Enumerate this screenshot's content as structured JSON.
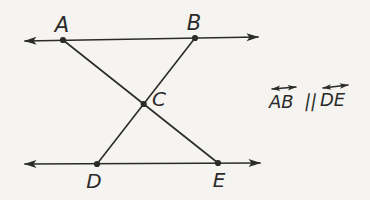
{
  "figure": {
    "labels": {
      "A": "A",
      "B": "B",
      "C": "C",
      "D": "D",
      "E": "E"
    },
    "statement": {
      "lhs": "AB",
      "operator": "||",
      "rhs": "DE"
    },
    "colors": {
      "background": "#f5f4f0",
      "ink": "#2b2b2b"
    }
  }
}
